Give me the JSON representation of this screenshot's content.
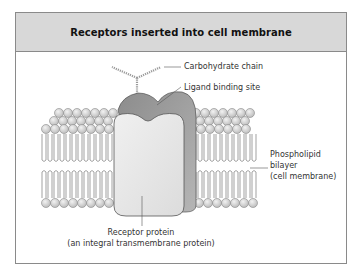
{
  "figure": {
    "title": "Receptors inserted into cell membrane",
    "labels": {
      "carbohydrate_chain": "Carbohydrate chain",
      "ligand_binding_site": "Ligand binding site",
      "phospholipid_line1": "Phospholipid",
      "phospholipid_line2": "bilayer",
      "phospholipid_line3": "(cell membrane)",
      "receptor_line1": "Receptor protein",
      "receptor_line2": "(an integral transmembrane protein)"
    },
    "colors": {
      "header_bg": "#d8d8d8",
      "frame_border": "#8a8a8a",
      "protein_front": "#e6e6e6",
      "protein_back": "#9a9a9a",
      "lipid_head": "#d4d4d4"
    }
  }
}
